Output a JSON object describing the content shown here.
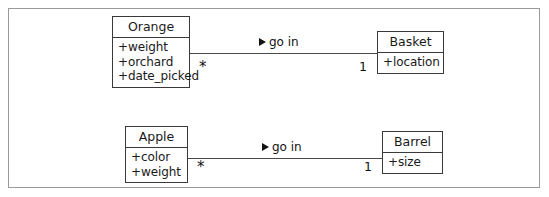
{
  "diagram": {
    "background_color": "#ffffff",
    "frame_color": "#9a9a9a",
    "line_color": "#4a4a4a",
    "text_color": "#1a1a1a"
  },
  "classes": [
    {
      "id": "orange",
      "name": "Orange",
      "attributes": [
        "+weight",
        "+orchard",
        "+date_picked"
      ]
    },
    {
      "id": "basket",
      "name": "Basket",
      "attributes": [
        "+location"
      ]
    },
    {
      "id": "apple",
      "name": "Apple",
      "attributes": [
        "+color",
        "+weight"
      ]
    },
    {
      "id": "barrel",
      "name": "Barrel",
      "attributes": [
        "+size"
      ]
    }
  ],
  "associations": [
    {
      "id": "orange-basket",
      "label": "go in",
      "direction_marker": "solid-right-triangle",
      "source": "Orange",
      "target": "Basket",
      "source_multiplicity": "*",
      "target_multiplicity": "1"
    },
    {
      "id": "apple-barrel",
      "label": "go in",
      "direction_marker": "solid-right-triangle",
      "source": "Apple",
      "target": "Barrel",
      "source_multiplicity": "*",
      "target_multiplicity": "1"
    }
  ]
}
